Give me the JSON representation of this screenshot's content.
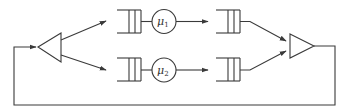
{
  "diagram": {
    "type": "queueing-network",
    "colors": {
      "stroke": "#3a3a3a",
      "background": "#ffffff"
    },
    "nodes": [
      {
        "id": "fork",
        "kind": "triangle-left",
        "label": ""
      },
      {
        "id": "queue_1a",
        "kind": "queue",
        "label": ""
      },
      {
        "id": "server_1",
        "kind": "server",
        "label": "μ",
        "subscript": "1"
      },
      {
        "id": "queue_1b",
        "kind": "queue",
        "label": ""
      },
      {
        "id": "queue_2a",
        "kind": "queue",
        "label": ""
      },
      {
        "id": "server_2",
        "kind": "server",
        "label": "μ",
        "subscript": "2"
      },
      {
        "id": "queue_2b",
        "kind": "queue",
        "label": ""
      },
      {
        "id": "join",
        "kind": "triangle-right",
        "label": ""
      }
    ],
    "edges": [
      {
        "from": "fork",
        "to": "queue_1a"
      },
      {
        "from": "fork",
        "to": "queue_2a"
      },
      {
        "from": "queue_1a",
        "to": "server_1"
      },
      {
        "from": "server_1",
        "to": "queue_1b"
      },
      {
        "from": "queue_2a",
        "to": "server_2"
      },
      {
        "from": "server_2",
        "to": "queue_2b"
      },
      {
        "from": "queue_1b",
        "to": "join"
      },
      {
        "from": "queue_2b",
        "to": "join"
      },
      {
        "from": "join",
        "to": "fork",
        "note": "feedback loop"
      }
    ],
    "labels": {
      "server_1_symbol": "μ",
      "server_1_sub": "1",
      "server_2_symbol": "μ",
      "server_2_sub": "2"
    }
  }
}
